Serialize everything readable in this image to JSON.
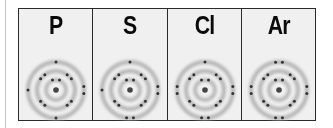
{
  "figure": {
    "colors": {
      "background": "#f0f0f0",
      "border": "#2a2a2a",
      "shell": "#b4b4b4",
      "electron": "#333333",
      "nucleus": "#444444"
    },
    "elements": [
      {
        "symbol": "P",
        "shells": [
          2,
          8,
          5
        ],
        "valence": {
          "top": 1,
          "left": 1,
          "right": 2,
          "bottom": 1
        }
      },
      {
        "symbol": "S",
        "shells": [
          2,
          8,
          6
        ],
        "valence": {
          "top": 1,
          "left": 1,
          "right": 2,
          "bottom": 2
        }
      },
      {
        "symbol": "Cl",
        "shells": [
          2,
          8,
          7
        ],
        "valence": {
          "top": 1,
          "left": 2,
          "right": 2,
          "bottom": 2
        }
      },
      {
        "symbol": "Ar",
        "shells": [
          2,
          8,
          8
        ],
        "valence": {
          "top": 2,
          "left": 2,
          "right": 2,
          "bottom": 2
        }
      }
    ]
  }
}
